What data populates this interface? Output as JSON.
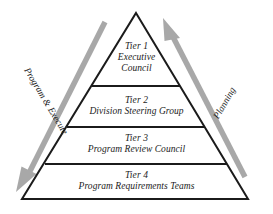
{
  "diagram": {
    "type": "pyramid",
    "orientation": "apex-up",
    "tier_count": 4,
    "background_color": "#ffffff",
    "outline_color": "#1b1b1b",
    "arrow_color": "#a8a8a8",
    "text_color": "#1b1b1b",
    "tiers": [
      {
        "id": "tier-1",
        "title": "Tier 1",
        "name_lines": [
          "Executive",
          "Council"
        ],
        "name": "Executive Council"
      },
      {
        "id": "tier-2",
        "title": "Tier 2",
        "name_lines": [
          "Division Steering Group"
        ],
        "name": "Division Steering Group"
      },
      {
        "id": "tier-3",
        "title": "Tier 3",
        "name_lines": [
          "Program Review Council"
        ],
        "name": "Program Review Council"
      },
      {
        "id": "tier-4",
        "title": "Tier 4",
        "name_lines": [
          "Program Requirements Teams"
        ],
        "name": "Program Requirements Teams"
      }
    ],
    "flows": [
      {
        "id": "flow-left",
        "label": "Program & Execute",
        "direction": "down-left",
        "side": "left",
        "color": "#a8a8a8"
      },
      {
        "id": "flow-right",
        "label": "Planning",
        "direction": "up-right",
        "side": "right",
        "color": "#a8a8a8"
      }
    ]
  }
}
